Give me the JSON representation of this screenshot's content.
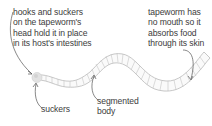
{
  "diagram": {
    "subject": "tapeworm",
    "labels": {
      "hooks": {
        "lines": [
          "hooks and suckers",
          "on the tapeworm's",
          "head hold it in place",
          "in its host's intestines"
        ]
      },
      "mouth": {
        "lines": [
          "tapeworm has",
          "no mouth so it",
          "absorbs food",
          "through its skin"
        ]
      },
      "suckers": {
        "lines": [
          "suckers"
        ]
      },
      "segmented": {
        "lines": [
          "segmented",
          "body"
        ]
      }
    },
    "colors": {
      "text": "#3c3c3c",
      "arrow": "#555555",
      "worm_outline": "#b9b9b9",
      "worm_fill": "#fafafa",
      "head_fill": "#e2e2e2"
    }
  }
}
